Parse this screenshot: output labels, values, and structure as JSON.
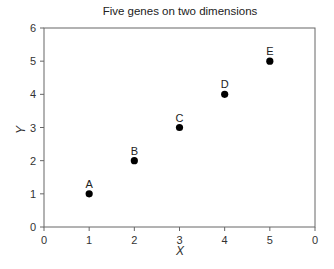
{
  "chart_data": {
    "type": "scatter",
    "title": "Five genes on two dimensions",
    "xlabel": "X",
    "ylabel": "Y",
    "xlim": [
      0,
      6
    ],
    "ylim": [
      0,
      6
    ],
    "x_ticks": [
      0,
      1,
      2,
      3,
      4,
      5,
      6
    ],
    "x_tick_labels": [
      "0",
      "1",
      "2",
      "3",
      "4",
      "5",
      "0"
    ],
    "y_ticks": [
      0,
      1,
      2,
      3,
      4,
      5,
      6
    ],
    "y_tick_labels": [
      "0",
      "1",
      "2",
      "3",
      "4",
      "5",
      "6"
    ],
    "grid": false,
    "legend": null,
    "points": [
      {
        "label": "A",
        "x": 1,
        "y": 1
      },
      {
        "label": "B",
        "x": 2,
        "y": 2
      },
      {
        "label": "C",
        "x": 3,
        "y": 3
      },
      {
        "label": "D",
        "x": 4,
        "y": 4
      },
      {
        "label": "E",
        "x": 5,
        "y": 5
      }
    ],
    "colors": {
      "marker": "#000000",
      "axis": "#555555",
      "text": "#222222"
    }
  }
}
